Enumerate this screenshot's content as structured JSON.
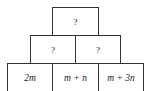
{
  "diagram": {
    "type": "number-pyramid",
    "rows": [
      {
        "row": "top",
        "cells": [
          {
            "label": "?"
          }
        ]
      },
      {
        "row": "middle",
        "cells": [
          {
            "label": "?"
          },
          {
            "label": "?"
          }
        ]
      },
      {
        "row": "bottom",
        "cells": [
          {
            "label": "2m"
          },
          {
            "label": "m + n"
          },
          {
            "label": "m + 3n"
          }
        ]
      }
    ]
  }
}
